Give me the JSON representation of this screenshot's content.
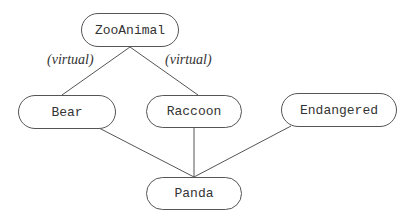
{
  "diagram": {
    "type": "class-inheritance",
    "nodes": {
      "zooanimal": "ZooAnimal",
      "bear": "Bear",
      "raccoon": "Raccoon",
      "endangered": "Endangered",
      "panda": "Panda"
    },
    "edge_labels": {
      "zooanimal_bear": "(virtual)",
      "zooanimal_raccoon": "(virtual)"
    },
    "edges": [
      {
        "from": "ZooAnimal",
        "to": "Bear",
        "label": "(virtual)"
      },
      {
        "from": "ZooAnimal",
        "to": "Raccoon",
        "label": "(virtual)"
      },
      {
        "from": "Bear",
        "to": "Panda"
      },
      {
        "from": "Raccoon",
        "to": "Panda"
      },
      {
        "from": "Endangered",
        "to": "Panda"
      }
    ]
  }
}
